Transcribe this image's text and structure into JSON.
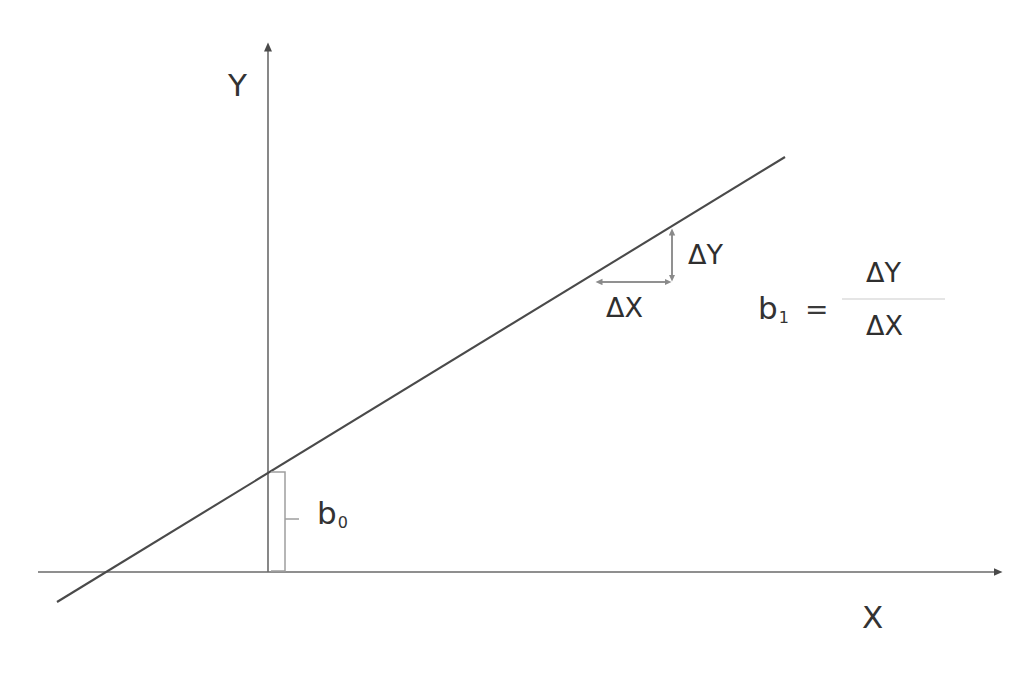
{
  "diagram": {
    "axes": {
      "y_label": "Y",
      "x_label": "X",
      "axis_color": "#555555",
      "origin": {
        "x": 268,
        "y": 572
      },
      "y_axis_top": {
        "x": 268,
        "y": 42
      },
      "x_axis_right": {
        "x": 1003,
        "y": 572
      }
    },
    "regression_line": {
      "color": "#4a4a4a",
      "start": {
        "x": 57,
        "y": 602
      },
      "end": {
        "x": 785,
        "y": 157
      },
      "x_intercept_px": {
        "x": 107,
        "y": 572
      },
      "y_intercept_px": {
        "x": 268,
        "y": 472
      },
      "slope_screen": -0.611
    },
    "intercept_annotation": {
      "label": "b",
      "subscript": "0",
      "bracket_color": "#9a9a9a",
      "bracket_x": 285,
      "bracket_top_y": 472,
      "bracket_bottom_y": 571,
      "tick_y": 519
    },
    "slope_annotation": {
      "delta_y_label": "ΔY",
      "delta_x_label": "ΔX",
      "arrow_color": "#8a8a8a",
      "vertical_arrow": {
        "x": 672,
        "y_top": 228,
        "y_bottom": 282
      },
      "horizontal_arrow": {
        "y": 282,
        "x_left": 595,
        "x_right": 672
      }
    },
    "formula": {
      "coefficient": "b",
      "coefficient_subscript": "1",
      "equals": "=",
      "numerator": "ΔY",
      "denominator": "ΔX",
      "bar_color": "#c8c8c8",
      "bar_x_start": 842,
      "bar_x_end": 945,
      "bar_y": 299
    }
  }
}
